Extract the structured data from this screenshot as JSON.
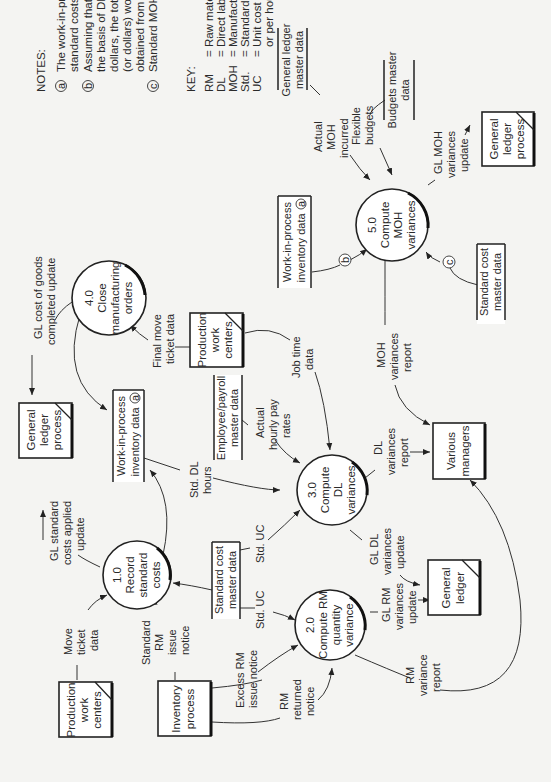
{
  "diagram": {
    "orientation": "rotated 90 degrees counter-clockwise",
    "notes": {
      "title": "NOTES:",
      "a": {
        "marker": "a",
        "lines": [
          "The work-in-process data reflect",
          "standard costs."
        ]
      },
      "b": {
        "marker": "b",
        "lines": [
          "Assuming that MOH is applied on",
          "the basis of DL hours or DL",
          "dollars, the total standard DL hours",
          "(or dollars) would be",
          "obtained from the work-in-process file."
        ]
      },
      "c": {
        "marker": "c",
        "lines": [
          "Standard MOH rate per hour."
        ]
      }
    },
    "key": {
      "title": "KEY:",
      "rows": [
        {
          "abbr": "RM",
          "def": "= Raw materials"
        },
        {
          "abbr": "DL",
          "def": "= Direct labor"
        },
        {
          "abbr": "MOH",
          "def": "= Manufacturing overhead"
        },
        {
          "abbr": "Std.",
          "def": "= Standard"
        },
        {
          "abbr": "UC",
          "def": "= Unit cost (per unit of RM"
        },
        {
          "abbr": "",
          "def": "or per hour of DL)"
        }
      ]
    },
    "processes": {
      "p1": {
        "lines": [
          "1.0",
          "Record",
          "standard",
          "costs"
        ]
      },
      "p2": {
        "lines": [
          "2.0",
          "Compute RM",
          "quantity",
          "variance"
        ]
      },
      "p3": {
        "lines": [
          "3.0",
          "Compute",
          "DL",
          "variances"
        ]
      },
      "p4": {
        "lines": [
          "4.0",
          "Close",
          "manufacturing",
          "orders"
        ]
      },
      "p5": {
        "lines": [
          "5.0",
          "Compute",
          "MOH",
          "variances"
        ]
      }
    },
    "entities": {
      "prod_wc_1": {
        "lines": [
          "Production",
          "work",
          "centers"
        ]
      },
      "inventory": {
        "lines": [
          "Inventory",
          "process"
        ]
      },
      "gl_process_1": {
        "lines": [
          "General",
          "ledger",
          "process"
        ]
      },
      "prod_wc_2": {
        "lines": [
          "Production",
          "work",
          "centers"
        ]
      },
      "gl_ledger": {
        "lines": [
          "General",
          "ledger"
        ]
      },
      "various_mgrs": {
        "lines": [
          "Various",
          "managers"
        ]
      },
      "gl_process_2": {
        "lines": [
          "General",
          "ledger",
          "process"
        ]
      }
    },
    "stores": {
      "std_cost_1": {
        "lines": [
          "Standard cost",
          "master data"
        ]
      },
      "wip_1": {
        "lines": [
          "Work-in-process",
          "inventory data"
        ],
        "marker": "a"
      },
      "emp_payroll": {
        "lines": [
          "Employee/payroll",
          "master data"
        ]
      },
      "wip_2": {
        "lines": [
          "Work-in-process",
          "inventory data"
        ],
        "marker": "a"
      },
      "gl_master": {
        "lines": [
          "General ledger",
          "master data"
        ]
      },
      "budgets": {
        "lines": [
          "Budgets master",
          "data"
        ]
      },
      "std_cost_2": {
        "lines": [
          "Standard cost",
          "master data"
        ]
      }
    },
    "flows": {
      "move_ticket": [
        "Move",
        "ticket",
        "data"
      ],
      "std_rm_issue": [
        "Standard",
        "RM",
        "issue",
        "notice"
      ],
      "excess_rm": [
        "Excess RM",
        "issue notice"
      ],
      "rm_returned": [
        "RM",
        "returned",
        "notice"
      ],
      "gl_std_costs": [
        "GL standard",
        "costs applied",
        "update"
      ],
      "std_uc_1": [
        "Std. UC"
      ],
      "std_uc_2": [
        "Std. UC"
      ],
      "gl_rm_var": [
        "GL RM",
        "variances",
        "update"
      ],
      "rm_var_report": [
        "RM",
        "variance",
        "report"
      ],
      "gl_cogs": [
        "GL cost of goods",
        "completed update"
      ],
      "std_dl_hours": [
        "Std. DL",
        "hours"
      ],
      "final_move": [
        "Final move",
        "ticket data"
      ],
      "actual_pay": [
        "Actual",
        "hourly pay",
        "rates"
      ],
      "job_time": [
        "Job time",
        "data"
      ],
      "gl_dl_var": [
        "GL DL",
        "variances",
        "update"
      ],
      "dl_var_report": [
        "DL",
        "variances",
        "report"
      ],
      "moh_var_report": [
        "MOH",
        "variances",
        "report"
      ],
      "actual_moh": [
        "Actual",
        "MOH",
        "incurred"
      ],
      "flex_budgets": [
        "Flexible",
        "budgets"
      ],
      "gl_moh_var": [
        "GL MOH",
        "variances",
        "update"
      ],
      "marker_b": "b",
      "marker_c": "c"
    }
  }
}
